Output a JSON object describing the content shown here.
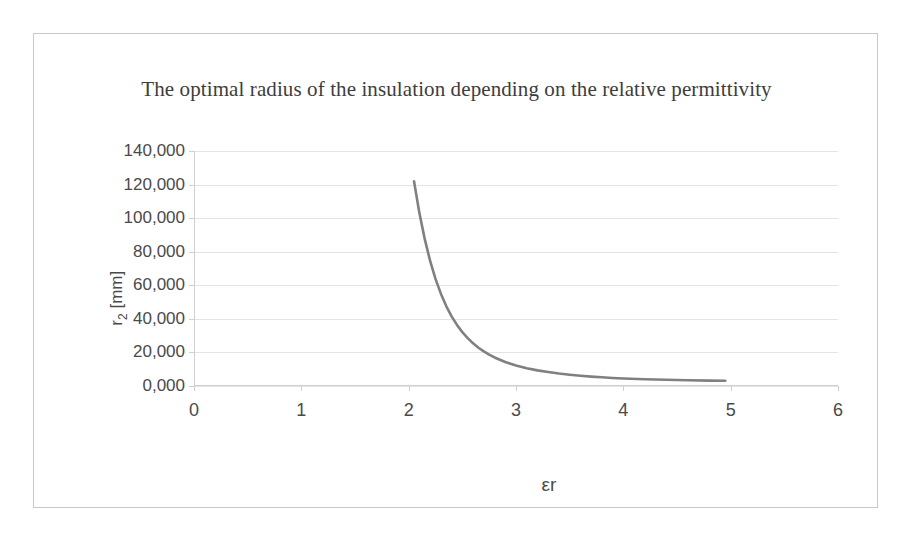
{
  "figure": {
    "border_color": "#c9c9c9",
    "background": "#ffffff"
  },
  "chart_data": {
    "type": "line",
    "title": "The optimal radius of the insulation depending on the relative permittivity",
    "xlabel": "εr",
    "ylabel": "r₂ [mm]",
    "ylabel_base": "r",
    "ylabel_sub": "2",
    "ylabel_unit": " [mm]",
    "xlim": [
      0,
      6
    ],
    "ylim": [
      0,
      140
    ],
    "xticks": [
      0,
      1,
      2,
      3,
      4,
      5,
      6
    ],
    "xtick_labels": [
      "0",
      "1",
      "2",
      "3",
      "4",
      "5",
      "6"
    ],
    "yticks": [
      0,
      20,
      40,
      60,
      80,
      100,
      120,
      140
    ],
    "ytick_labels": [
      "0,000",
      "20,000",
      "40,000",
      "60,000",
      "80,000",
      "100,000",
      "120,000",
      "140,000"
    ],
    "grid": "horizontal",
    "grid_color": "#e4e4e4",
    "legend": "none",
    "series": [
      {
        "name": "optimal radius",
        "color": "#808080",
        "line_width": 2.6,
        "x": [
          2.05,
          2.1,
          2.15,
          2.2,
          2.25,
          2.3,
          2.35,
          2.4,
          2.45,
          2.5,
          2.55,
          2.6,
          2.65,
          2.7,
          2.75,
          2.8,
          2.85,
          2.9,
          2.95,
          3.0,
          3.1,
          3.2,
          3.3,
          3.4,
          3.5,
          3.6,
          3.7,
          3.8,
          3.9,
          4.0,
          4.2,
          4.4,
          4.6,
          4.8,
          4.95
        ],
        "y": [
          122.0,
          103.0,
          87.5,
          74.5,
          63.8,
          55.0,
          47.6,
          41.5,
          36.4,
          32.1,
          28.5,
          25.4,
          22.8,
          20.6,
          18.7,
          17.0,
          15.6,
          14.3,
          13.2,
          12.2,
          10.6,
          9.3,
          8.3,
          7.4,
          6.7,
          6.1,
          5.6,
          5.2,
          4.8,
          4.5,
          4.0,
          3.7,
          3.4,
          3.2,
          3.1
        ]
      }
    ]
  }
}
